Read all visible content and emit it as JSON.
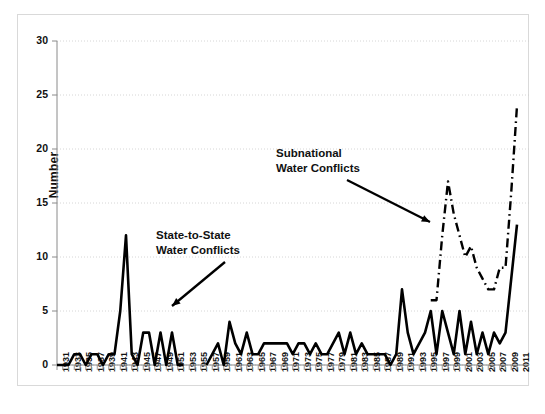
{
  "chart_data": {
    "type": "line",
    "title": "",
    "xlabel": "",
    "ylabel": "Number",
    "ylim": [
      0,
      30
    ],
    "yticks": [
      0,
      5,
      10,
      15,
      20,
      25,
      30
    ],
    "xlim": [
      1931,
      2011
    ],
    "grid": true,
    "legend_position": "annotations",
    "x": [
      1931,
      1932,
      1933,
      1934,
      1935,
      1936,
      1937,
      1938,
      1939,
      1940,
      1941,
      1942,
      1943,
      1944,
      1945,
      1946,
      1947,
      1948,
      1949,
      1950,
      1951,
      1952,
      1953,
      1954,
      1955,
      1956,
      1957,
      1958,
      1959,
      1960,
      1961,
      1962,
      1963,
      1964,
      1965,
      1966,
      1967,
      1968,
      1969,
      1970,
      1971,
      1972,
      1973,
      1974,
      1975,
      1976,
      1977,
      1978,
      1979,
      1980,
      1981,
      1982,
      1983,
      1984,
      1985,
      1986,
      1987,
      1988,
      1989,
      1990,
      1991,
      1992,
      1993,
      1994,
      1995,
      1996,
      1997,
      1998,
      1999,
      2000,
      2001,
      2002,
      2003,
      2004,
      2005,
      2006,
      2007,
      2008,
      2009,
      2010,
      2011
    ],
    "xtick_labels": [
      "1931",
      "1933",
      "1935",
      "1937",
      "1939",
      "1941",
      "1943",
      "1945",
      "1947",
      "1949",
      "1951",
      "1953",
      "1955",
      "1957",
      "1959",
      "1961",
      "1963",
      "1965",
      "1967",
      "1969",
      "1971",
      "1973",
      "1975",
      "1977",
      "1979",
      "1981",
      "1983",
      "1985",
      "1987",
      "1989",
      "1991",
      "1993",
      "1995",
      "1997",
      "1999",
      "2001",
      "2003",
      "2005",
      "2007",
      "2009",
      "2011"
    ],
    "series": [
      {
        "name": "State-to-State Water Conflicts",
        "style": "solid",
        "color": "#000000",
        "values": [
          0,
          0,
          0,
          1,
          1,
          0,
          1,
          1,
          0,
          1,
          1,
          5,
          12,
          1,
          0,
          3,
          3,
          0,
          3,
          0,
          3,
          0,
          0,
          null,
          null,
          null,
          0,
          1,
          2,
          0,
          4,
          2,
          1,
          3,
          1,
          1,
          2,
          2,
          2,
          2,
          2,
          1,
          2,
          2,
          1,
          2,
          1,
          1,
          2,
          3,
          1,
          3,
          1,
          2,
          1,
          1,
          1,
          1,
          0,
          1,
          7,
          3,
          1,
          2,
          3,
          5,
          1,
          5,
          3,
          1,
          5,
          1,
          4,
          1,
          3,
          1,
          3,
          2,
          3,
          8,
          13
        ]
      },
      {
        "name": "Subnational Water Conflicts",
        "style": "dash-dot",
        "color": "#000000",
        "values": [
          null,
          null,
          null,
          null,
          null,
          null,
          null,
          null,
          null,
          null,
          null,
          null,
          null,
          null,
          null,
          null,
          null,
          null,
          null,
          null,
          null,
          null,
          null,
          null,
          null,
          null,
          null,
          null,
          null,
          null,
          null,
          null,
          null,
          null,
          null,
          null,
          null,
          null,
          null,
          null,
          null,
          null,
          null,
          null,
          null,
          null,
          null,
          null,
          null,
          null,
          null,
          null,
          null,
          null,
          null,
          null,
          null,
          null,
          null,
          null,
          null,
          null,
          null,
          null,
          null,
          6,
          6,
          12,
          17,
          14,
          12,
          10,
          11,
          9,
          8,
          7,
          7,
          9,
          9,
          16,
          24
        ]
      }
    ],
    "annotations": [
      {
        "id": "state-to-state",
        "lines": [
          "State-to-State",
          "Water Conflicts"
        ],
        "arrow_from": [
          225,
          262
        ],
        "arrow_to": [
          172,
          306
        ]
      },
      {
        "id": "subnational",
        "lines": [
          "Subnational",
          "Water Conflicts"
        ],
        "arrow_from": [
          347,
          180
        ],
        "arrow_to": [
          430,
          222
        ]
      }
    ]
  },
  "axes": {
    "y_label": "Number",
    "y_ticks": [
      "0",
      "5",
      "10",
      "15",
      "20",
      "25",
      "30"
    ]
  }
}
